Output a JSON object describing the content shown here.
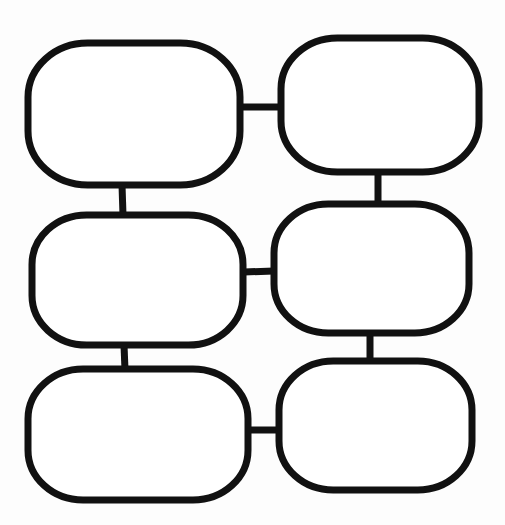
{
  "diagram": {
    "type": "bubble-chain-organizer",
    "stroke_color": "#111111",
    "background_color": "#fdfdfd",
    "stroke_width": 7,
    "nodes": [
      {
        "id": "node-1",
        "label": "",
        "row": 1,
        "col": 1,
        "x": 28,
        "y": 43,
        "w": 212,
        "h": 142
      },
      {
        "id": "node-2",
        "label": "",
        "row": 1,
        "col": 2,
        "x": 281,
        "y": 38,
        "w": 198,
        "h": 134
      },
      {
        "id": "node-3",
        "label": "",
        "row": 2,
        "col": 1,
        "x": 32,
        "y": 215,
        "w": 211,
        "h": 130
      },
      {
        "id": "node-4",
        "label": "",
        "row": 2,
        "col": 2,
        "x": 274,
        "y": 204,
        "w": 195,
        "h": 129
      },
      {
        "id": "node-5",
        "label": "",
        "row": 3,
        "col": 1,
        "x": 28,
        "y": 369,
        "w": 220,
        "h": 131
      },
      {
        "id": "node-6",
        "label": "",
        "row": 3,
        "col": 2,
        "x": 279,
        "y": 361,
        "w": 193,
        "h": 129
      }
    ],
    "connectors": [
      {
        "from": "node-1",
        "to": "node-2",
        "x1": 240,
        "y1": 107,
        "x2": 281,
        "y2": 107
      },
      {
        "from": "node-1",
        "to": "node-3",
        "x1": 122,
        "y1": 185,
        "x2": 123,
        "y2": 215
      },
      {
        "from": "node-2",
        "to": "node-4",
        "x1": 378,
        "y1": 172,
        "x2": 378,
        "y2": 205
      },
      {
        "from": "node-3",
        "to": "node-4",
        "x1": 244,
        "y1": 272,
        "x2": 274,
        "y2": 271
      },
      {
        "from": "node-3",
        "to": "node-5",
        "x1": 124,
        "y1": 345,
        "x2": 125,
        "y2": 370
      },
      {
        "from": "node-4",
        "to": "node-6",
        "x1": 370,
        "y1": 333,
        "x2": 370,
        "y2": 362
      },
      {
        "from": "node-5",
        "to": "node-6",
        "x1": 248,
        "y1": 430,
        "x2": 279,
        "y2": 430
      }
    ]
  }
}
